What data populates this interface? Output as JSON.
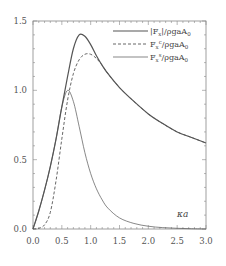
{
  "chart_data": {
    "type": "line",
    "title": "",
    "xlabel": "κa",
    "ylabel": "",
    "xlim": [
      0.0,
      3.0
    ],
    "ylim": [
      0.0,
      1.5
    ],
    "grid": false,
    "legend_position": "upper right",
    "x_ticks": [
      "0.0",
      "0.5",
      "1.0",
      "1.5",
      "2.0",
      "2.5",
      "3.0"
    ],
    "y_ticks": [
      "0.0",
      "0.5",
      "1.0",
      "1.5"
    ],
    "series": [
      {
        "name": "|Fx|/ρgaA0",
        "style": "solid",
        "x": [
          0,
          0.1,
          0.2,
          0.3,
          0.4,
          0.5,
          0.6,
          0.7,
          0.8,
          0.9,
          1.0,
          1.1,
          1.2,
          1.3,
          1.5,
          1.75,
          2.0,
          2.25,
          2.5,
          2.75,
          3.0
        ],
        "values": [
          0,
          0.13,
          0.28,
          0.45,
          0.65,
          0.88,
          1.1,
          1.3,
          1.4,
          1.39,
          1.33,
          1.25,
          1.18,
          1.12,
          1.02,
          0.92,
          0.83,
          0.76,
          0.7,
          0.66,
          0.62
        ]
      },
      {
        "name": "Fx^c/ρgaA0",
        "style": "dashed",
        "x": [
          0,
          0.1,
          0.2,
          0.3,
          0.4,
          0.5,
          0.6,
          0.7,
          0.8,
          0.9,
          1.0,
          1.1,
          1.2,
          1.3,
          1.5,
          1.75,
          2.0,
          2.25,
          2.5,
          2.75,
          3.0
        ],
        "values": [
          0,
          0.005,
          0.03,
          0.12,
          0.35,
          0.65,
          0.93,
          1.12,
          1.22,
          1.26,
          1.26,
          1.23,
          1.18,
          1.12,
          1.02,
          0.92,
          0.83,
          0.76,
          0.7,
          0.66,
          0.62
        ]
      },
      {
        "name": "Fx^s/ρgaA0",
        "style": "thin",
        "x": [
          0,
          0.1,
          0.2,
          0.3,
          0.4,
          0.5,
          0.6,
          0.7,
          0.8,
          0.9,
          1.0,
          1.1,
          1.2,
          1.3,
          1.5,
          1.75,
          2.0,
          2.25,
          2.5,
          2.75,
          3.0
        ],
        "values": [
          0,
          0.13,
          0.28,
          0.45,
          0.65,
          0.88,
          1.0,
          0.92,
          0.74,
          0.55,
          0.4,
          0.29,
          0.21,
          0.15,
          0.08,
          0.04,
          0.02,
          0.01,
          0.005,
          0.002,
          0.0
        ]
      }
    ]
  },
  "legend": {
    "items": [
      {
        "base": "|F",
        "sub": "x",
        "sup": "",
        "tail": "|/ρgaA",
        "tail_sub": "0"
      },
      {
        "base": "F",
        "sub": "x",
        "sup": "c",
        "tail": "/ρgaA",
        "tail_sub": "0"
      },
      {
        "base": "F",
        "sub": "x",
        "sup": "s",
        "tail": "/ρgaA",
        "tail_sub": "0"
      }
    ]
  },
  "axis": {
    "x_label": "κa"
  },
  "colors": {
    "axis": "#888888",
    "line": "#555555",
    "text": "#555555"
  }
}
